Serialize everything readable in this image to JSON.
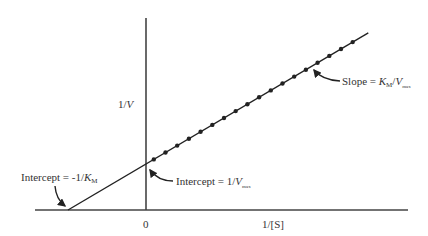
{
  "chart_data": {
    "type": "line",
    "xlabel": "1/[S]",
    "ylabel_parts": {
      "main": "1/",
      "italic": "V"
    },
    "x_zero_label": "0",
    "xlim": [
      -1.0,
      3.5
    ],
    "ylim": [
      0,
      2.6
    ],
    "series": [
      {
        "name": "double-reciprocal data",
        "x_intercept": -1.0,
        "y_intercept": 0.45,
        "slope": 0.45,
        "points_x": [
          0.1,
          0.25,
          0.4,
          0.55,
          0.7,
          0.85,
          1.0,
          1.15,
          1.3,
          1.45,
          1.6,
          1.75,
          1.9,
          2.05,
          2.2,
          2.35,
          2.5,
          2.65
        ],
        "line_x_range": [
          -1.0,
          2.85
        ]
      }
    ],
    "annotations": {
      "slope": {
        "prefix": "Slope = ",
        "k": "K",
        "k_sub": "M",
        "slash": "/",
        "v": "V",
        "v_sub": "max"
      },
      "y_intercept": {
        "prefix": "Intercept = 1/",
        "v": "V",
        "v_sub": "max"
      },
      "x_intercept": {
        "prefix": "Intercept = -1/",
        "k": "K",
        "k_sub": "M"
      }
    },
    "grid": false,
    "colors": {
      "axis": "#444444",
      "line": "#222222",
      "dot": "#222222",
      "text": "#333333"
    }
  }
}
